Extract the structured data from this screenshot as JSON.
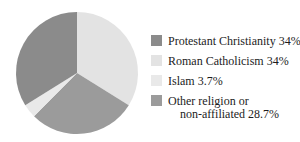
{
  "background": "#ffffff",
  "text_color": "#1c1c1c",
  "chart_data": {
    "type": "pie",
    "title": "",
    "slices": [
      {
        "label": "Protestant Christianity",
        "value": 34,
        "display": "34%",
        "color": "#8b8b8b"
      },
      {
        "label": "Roman Catholicism",
        "value": 34,
        "display": "34%",
        "color": "#e3e3e3"
      },
      {
        "label": "Islam",
        "value": 3.7,
        "display": "3.7%",
        "color": "#e9e9e9"
      },
      {
        "label": "Other religion or non-affiliated",
        "value": 28.7,
        "display": "28.7%",
        "color": "#9b9b9b"
      }
    ],
    "clockwise_order_from_top": [
      1,
      3,
      2,
      0
    ],
    "legend_position": "right",
    "grid": false
  },
  "legend": {
    "items": [
      {
        "label": "Protestant Christianity 34%"
      },
      {
        "label": "Roman Catholicism 34%"
      },
      {
        "label": "Islam 3.7%"
      },
      {
        "label": "Other religion or",
        "label2": "non-affiliated 28.7%"
      }
    ]
  }
}
